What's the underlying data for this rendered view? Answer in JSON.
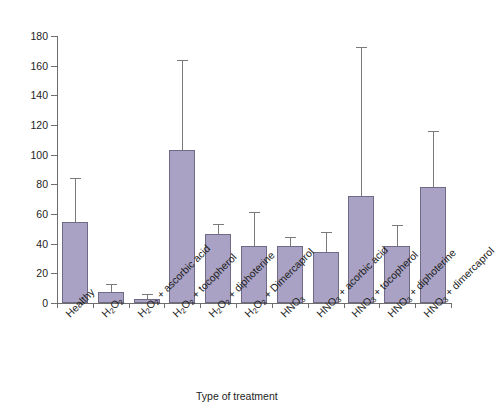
{
  "chart_data": {
    "type": "bar",
    "title": "",
    "xlabel": "Type of treatment",
    "ylabel": "",
    "ylim": [
      0,
      180
    ],
    "ytick_step": 20,
    "yticks": [
      0,
      20,
      40,
      60,
      80,
      100,
      120,
      140,
      160,
      180
    ],
    "grid": false,
    "legend": null,
    "bar_color": "#a9a2c4",
    "bar_edge_color": "#6f6a85",
    "error_bar_color": "#7a7a7a",
    "axis_color": "#6e6e6e",
    "categories": [
      "Healthy",
      "H₂O₂",
      "H₂O₂ + ascorbic acid",
      "H₂O₂ + tocopherol",
      "H₂O₂ + diphoterine",
      "H₂O₂ + Dimercaprol",
      "HNO₃",
      "HNO₃ + acorbic acid",
      "HNO₃ + tocopherol",
      "HNO₃ + diphoterine",
      "HNO₃ + dimercaprol"
    ],
    "values": [
      54.5,
      7.5,
      3.0,
      103.0,
      46.5,
      38.5,
      38.5,
      34.5,
      72.0,
      38.5,
      78.0
    ],
    "errors_upper": [
      83.5,
      12.0,
      5.5,
      163.0,
      52.5,
      60.5,
      44.0,
      47.0,
      172.0,
      52.0,
      115.5
    ]
  },
  "axis": {
    "x_title": "Type of treatment"
  },
  "categories_html": [
    "Healthy",
    "H<sub>2</sub>O<sub>2</sub>",
    "H<sub>2</sub>O<sub>2</sub> + ascorbic acid",
    "H<sub>2</sub>O<sub>2</sub> + tocopherol",
    "H<sub>2</sub>O<sub>2</sub> + diphoterine",
    "H<sub>2</sub>O<sub>2</sub> + Dimercaprol",
    "HNO<sub>3</sub>",
    "HNO<sub>3</sub> + acorbic acid",
    "HNO<sub>3</sub> + tocopherol",
    "HNO<sub>3</sub> + diphoterine",
    "HNO<sub>3</sub> + dimercaprol"
  ]
}
